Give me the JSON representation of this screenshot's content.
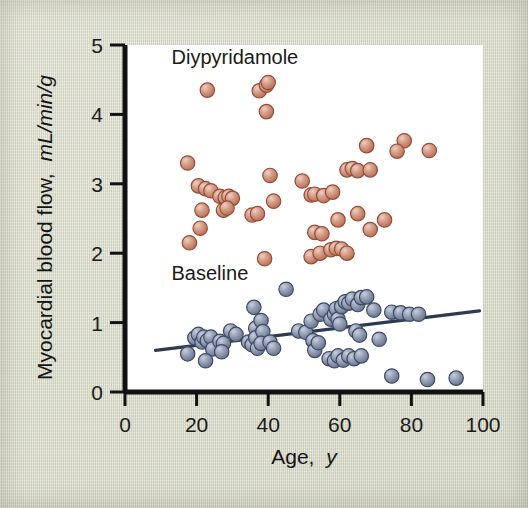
{
  "chart_data": {
    "type": "scatter",
    "title": "",
    "xlabel": "Age, y",
    "ylabel": "Myocardial blood flow, mL/min/g",
    "xlabel_plain": "Age,",
    "xlabel_italic": "y",
    "ylabel_plain": "Myocardial blood flow,",
    "ylabel_italic": "mL/min/g",
    "xlim": [
      0,
      100
    ],
    "ylim": [
      0,
      5
    ],
    "xticks": [
      0,
      20,
      40,
      60,
      80,
      100
    ],
    "yticks": [
      0,
      1,
      2,
      3,
      4,
      5
    ],
    "xtick_labels": [
      "0",
      "20",
      "40",
      "60",
      "80",
      "100"
    ],
    "ytick_labels": [
      "0",
      "1",
      "2",
      "3",
      "4",
      "5"
    ],
    "grid": false,
    "legend_position": "in-plot-annotations",
    "annotations": [
      {
        "name": "dipyridamole-label",
        "text": "Diypyridamole",
        "x": 13,
        "y": 4.72
      },
      {
        "name": "baseline-label",
        "text": "Baseline",
        "x": 13,
        "y": 1.62
      }
    ],
    "series": [
      {
        "name": "Diypyridamole",
        "marker": "circle",
        "color": "#c98b76",
        "edge_color": "#9a4b37",
        "points": [
          [
            23.0,
            4.35
          ],
          [
            37.5,
            4.34
          ],
          [
            39.5,
            4.42
          ],
          [
            40.0,
            4.46
          ],
          [
            39.5,
            4.04
          ],
          [
            17.5,
            3.3
          ],
          [
            20.5,
            2.97
          ],
          [
            22.5,
            2.93
          ],
          [
            24.0,
            2.9
          ],
          [
            26.5,
            2.82
          ],
          [
            28.0,
            2.8
          ],
          [
            29.0,
            2.82
          ],
          [
            30.0,
            2.79
          ],
          [
            27.5,
            2.62
          ],
          [
            28.5,
            2.65
          ],
          [
            21.5,
            2.62
          ],
          [
            21.0,
            2.36
          ],
          [
            18.0,
            2.15
          ],
          [
            35.5,
            2.55
          ],
          [
            37.0,
            2.57
          ],
          [
            40.5,
            3.12
          ],
          [
            41.5,
            2.75
          ],
          [
            39.0,
            1.92
          ],
          [
            49.5,
            3.04
          ],
          [
            52.0,
            2.84
          ],
          [
            53.0,
            2.85
          ],
          [
            55.5,
            2.83
          ],
          [
            58.0,
            2.88
          ],
          [
            62.0,
            3.2
          ],
          [
            63.5,
            3.22
          ],
          [
            65.0,
            3.19
          ],
          [
            68.5,
            3.2
          ],
          [
            67.5,
            3.55
          ],
          [
            78.0,
            3.62
          ],
          [
            76.0,
            3.47
          ],
          [
            85.0,
            3.48
          ],
          [
            59.5,
            2.48
          ],
          [
            65.0,
            2.57
          ],
          [
            72.5,
            2.48
          ],
          [
            68.5,
            2.34
          ],
          [
            53.0,
            2.3
          ],
          [
            55.0,
            2.28
          ],
          [
            52.0,
            1.95
          ],
          [
            54.5,
            2.0
          ],
          [
            57.5,
            2.05
          ],
          [
            59.0,
            2.07
          ],
          [
            60.5,
            2.06
          ],
          [
            62.0,
            2.0
          ]
        ]
      },
      {
        "name": "Baseline",
        "marker": "circle",
        "color": "#8a95ad",
        "edge_color": "#3e4a66",
        "points": [
          [
            17.5,
            0.55
          ],
          [
            19.5,
            0.78
          ],
          [
            20.5,
            0.83
          ],
          [
            21.5,
            0.72
          ],
          [
            22.0,
            0.79
          ],
          [
            23.0,
            0.74
          ],
          [
            24.0,
            0.79
          ],
          [
            24.5,
            0.62
          ],
          [
            22.5,
            0.45
          ],
          [
            26.5,
            0.73
          ],
          [
            27.5,
            0.7
          ],
          [
            27.0,
            0.58
          ],
          [
            29.5,
            0.88
          ],
          [
            31.0,
            0.83
          ],
          [
            34.5,
            0.72
          ],
          [
            35.5,
            0.68
          ],
          [
            36.5,
            0.92
          ],
          [
            36.5,
            0.78
          ],
          [
            37.0,
            0.63
          ],
          [
            38.0,
            1.03
          ],
          [
            38.5,
            0.87
          ],
          [
            38.0,
            0.7
          ],
          [
            36.0,
            1.22
          ],
          [
            40.5,
            0.72
          ],
          [
            41.5,
            0.63
          ],
          [
            45.0,
            1.48
          ],
          [
            48.5,
            0.88
          ],
          [
            50.5,
            0.86
          ],
          [
            52.0,
            1.02
          ],
          [
            52.5,
            0.74
          ],
          [
            53.0,
            0.6
          ],
          [
            54.0,
            0.71
          ],
          [
            54.5,
            1.12
          ],
          [
            55.5,
            1.18
          ],
          [
            57.5,
            1.05
          ],
          [
            58.5,
            1.12
          ],
          [
            59.0,
            1.2
          ],
          [
            59.5,
            1.05
          ],
          [
            60.0,
            0.98
          ],
          [
            60.5,
            1.23
          ],
          [
            61.5,
            1.3
          ],
          [
            62.5,
            1.28
          ],
          [
            63.5,
            1.34
          ],
          [
            65.0,
            1.26
          ],
          [
            66.0,
            1.36
          ],
          [
            67.5,
            1.37
          ],
          [
            57.0,
            0.48
          ],
          [
            58.5,
            0.45
          ],
          [
            59.5,
            0.52
          ],
          [
            61.0,
            0.46
          ],
          [
            62.5,
            0.52
          ],
          [
            64.0,
            0.48
          ],
          [
            66.0,
            0.52
          ],
          [
            64.5,
            0.88
          ],
          [
            65.5,
            0.82
          ],
          [
            69.5,
            1.18
          ],
          [
            71.0,
            0.76
          ],
          [
            74.5,
            1.15
          ],
          [
            77.0,
            1.14
          ],
          [
            79.5,
            1.12
          ],
          [
            82.0,
            1.12
          ],
          [
            74.5,
            0.23
          ],
          [
            84.5,
            0.18
          ],
          [
            92.5,
            0.2
          ]
        ]
      }
    ],
    "trendline": {
      "name": "baseline-regression-line",
      "series": "Baseline",
      "color": "#2c3a52",
      "x_start": 8.5,
      "y_start": 0.6,
      "x_end": 99.0,
      "y_end": 1.17
    }
  }
}
